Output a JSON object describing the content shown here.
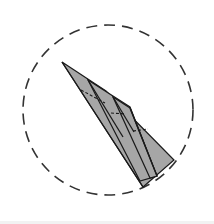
{
  "diagram": {
    "type": "origami-fold-step",
    "colors": {
      "background": "#ffffff",
      "paper_fill": "#a6a6a6",
      "stroke": "#1a1a1a",
      "circle_stroke": "#333333"
    },
    "focus_circle": {
      "cx": 108,
      "cy": 110,
      "r": 85,
      "dash": "11 7"
    },
    "shapes": {
      "outer_flap": "62,62 106,91 174,160 143,187",
      "middle_flap": "88,80 130,107 157,176 140,181",
      "inner_flap": "113,97 130,108 157,176 150,178"
    },
    "lines": [
      {
        "name": "crease-1",
        "x1": 62,
        "y1": 62,
        "x2": 143,
        "y2": 187
      },
      {
        "name": "crease-2",
        "x1": 88,
        "y1": 80,
        "x2": 123,
        "y2": 137
      },
      {
        "name": "crease-3",
        "x1": 113,
        "y1": 97,
        "x2": 134,
        "y2": 132
      },
      {
        "name": "crease-4",
        "x1": 130,
        "y1": 108,
        "x2": 157,
        "y2": 176
      }
    ],
    "hidden_lines": [
      {
        "name": "hidden-1",
        "x1": 81,
        "y1": 90,
        "x2": 105,
        "y2": 103
      },
      {
        "name": "hidden-2",
        "x1": 111,
        "y1": 113,
        "x2": 126,
        "y2": 114
      },
      {
        "name": "hidden-3",
        "x1": 133,
        "y1": 131,
        "x2": 148,
        "y2": 129
      }
    ]
  }
}
